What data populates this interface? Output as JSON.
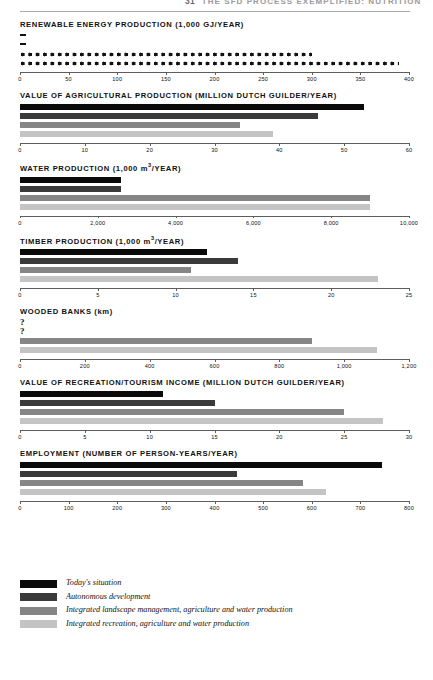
{
  "header": {
    "page_number": "31",
    "title": "THE SFD PROCESS EXEMPLIFIED: NUTRITION"
  },
  "legend": {
    "items": [
      {
        "label": "Today's situation",
        "color": "#0a0a0a"
      },
      {
        "label": "Autonomous development",
        "color": "#3a3a3a"
      },
      {
        "label": "Integrated landscape management, agriculture and water production",
        "color": "#858585"
      },
      {
        "label": "Integrated recreation, agriculture and water production",
        "color": "#c4c4c4"
      }
    ]
  },
  "chart_data": [
    {
      "type": "bar",
      "orientation": "horizontal",
      "title": "RENEWABLE ENERGY PRODUCTION (1,000 GJ/YEAR)",
      "unit": "1,000 GJ/year",
      "style": "pictogram",
      "categories": [
        "Today's situation",
        "Autonomous development",
        "Integrated landscape management, agriculture and water production",
        "Integrated recreation, agriculture and water production"
      ],
      "values": [
        4,
        4,
        300,
        390
      ],
      "xlabel": "",
      "ylabel": "",
      "xlim": [
        0,
        400
      ],
      "ticks": [
        0,
        50,
        100,
        150,
        200,
        250,
        300,
        350,
        400
      ],
      "tick_labels": [
        "0",
        "50",
        "100",
        "150",
        "200",
        "250",
        "300",
        "350",
        "400"
      ],
      "grid": false
    },
    {
      "type": "bar",
      "orientation": "horizontal",
      "title": "VALUE OF AGRICULTURAL PRODUCTION (MILLION DUTCH GUILDER/YEAR)",
      "unit": "million Dutch guilder/year",
      "style": "bar",
      "categories": [
        "Today's situation",
        "Autonomous development",
        "Integrated landscape management, agriculture and water production",
        "Integrated recreation, agriculture and water production"
      ],
      "values": [
        53,
        46,
        34,
        39
      ],
      "xlabel": "",
      "ylabel": "",
      "xlim": [
        0,
        60
      ],
      "ticks": [
        0,
        10,
        20,
        30,
        40,
        50,
        60
      ],
      "tick_labels": [
        "0",
        "10",
        "20",
        "30",
        "40",
        "50",
        "60"
      ],
      "grid": false
    },
    {
      "type": "bar",
      "orientation": "horizontal",
      "title": "WATER PRODUCTION (1,000 m3/YEAR)",
      "title_main": "WATER PRODUCTION (1,000 m",
      "title_sup": "3",
      "title_tail": "/YEAR)",
      "unit": "1,000 m3/year",
      "style": "bar",
      "categories": [
        "Today's situation",
        "Autonomous development",
        "Integrated landscape management, agriculture and water production",
        "Integrated recreation, agriculture and water production"
      ],
      "values": [
        2600,
        2600,
        9000,
        9000
      ],
      "xlabel": "",
      "ylabel": "",
      "xlim": [
        0,
        10000
      ],
      "ticks": [
        0,
        2000,
        4000,
        6000,
        8000,
        10000
      ],
      "tick_labels": [
        "0",
        "2,000",
        "4,000",
        "6,000",
        "8,000",
        "10,000"
      ],
      "grid": false
    },
    {
      "type": "bar",
      "orientation": "horizontal",
      "title": "TIMBER PRODUCTION (1,000 m3/YEAR)",
      "title_main": "TIMBER PRODUCTION (1,000 m",
      "title_sup": "3",
      "title_tail": "/YEAR)",
      "unit": "1,000 m3/year",
      "style": "bar",
      "categories": [
        "Today's situation",
        "Autonomous development",
        "Integrated landscape management, agriculture and water production",
        "Integrated recreation, agriculture and water production"
      ],
      "values": [
        12,
        14,
        11,
        23
      ],
      "xlabel": "",
      "ylabel": "",
      "xlim": [
        0,
        25
      ],
      "ticks": [
        0,
        5,
        10,
        15,
        20,
        25
      ],
      "tick_labels": [
        "0",
        "5",
        "10",
        "15",
        "20",
        "25"
      ],
      "grid": false
    },
    {
      "type": "bar",
      "orientation": "horizontal",
      "title": "WOODED BANKS (km)",
      "title_main": "WOODED BANKS ",
      "title_tail": "(km)",
      "unit": "km",
      "style": "bar",
      "categories": [
        "Today's situation",
        "Autonomous development",
        "Integrated landscape management, agriculture and water production",
        "Integrated recreation, agriculture and water production"
      ],
      "values": [
        null,
        null,
        900,
        1100
      ],
      "value_labels": [
        "?",
        "?",
        "900",
        "1,100"
      ],
      "xlabel": "",
      "ylabel": "",
      "xlim": [
        0,
        1200
      ],
      "ticks": [
        0,
        200,
        400,
        600,
        800,
        1000,
        1200
      ],
      "tick_labels": [
        "0",
        "200",
        "400",
        "600",
        "800",
        "1,000",
        "1,200"
      ],
      "grid": false
    },
    {
      "type": "bar",
      "orientation": "horizontal",
      "title": "VALUE OF RECREATION/TOURISM INCOME (MILLION DUTCH GUILDER/YEAR)",
      "unit": "million Dutch guilder/year",
      "style": "bar",
      "categories": [
        "Today's situation",
        "Autonomous development",
        "Integrated landscape management, agriculture and water production",
        "Integrated recreation, agriculture and water production"
      ],
      "values": [
        11,
        15,
        25,
        28
      ],
      "xlabel": "",
      "ylabel": "",
      "xlim": [
        0,
        30
      ],
      "ticks": [
        0,
        5,
        10,
        15,
        20,
        25,
        30
      ],
      "tick_labels": [
        "0",
        "5",
        "10",
        "15",
        "20",
        "25",
        "30"
      ],
      "grid": false
    },
    {
      "type": "bar",
      "orientation": "horizontal",
      "title": "EMPLOYMENT (NUMBER OF PERSON-YEARS/YEAR)",
      "unit": "person-years/year",
      "style": "bar",
      "categories": [
        "Today's situation",
        "Autonomous development",
        "Integrated landscape management, agriculture and water production",
        "Integrated recreation, agriculture and water production"
      ],
      "values": [
        745,
        447,
        582,
        630
      ],
      "xlabel": "",
      "ylabel": "",
      "xlim": [
        0,
        800
      ],
      "ticks": [
        0,
        100,
        200,
        300,
        400,
        500,
        600,
        700,
        800
      ],
      "tick_labels": [
        "0",
        "100",
        "200",
        "300",
        "400",
        "500",
        "600",
        "700",
        "800"
      ],
      "grid": false
    }
  ]
}
